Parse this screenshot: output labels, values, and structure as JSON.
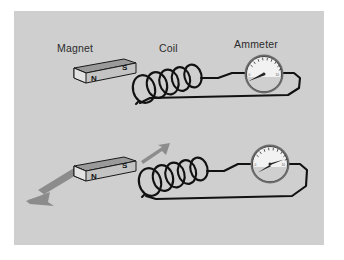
{
  "figure": {
    "panel_background": "#cfcfcf",
    "page_background": "#ffffff",
    "wire_color": "#111111",
    "magnet_body_color": "#c3c3c3",
    "magnet_top_color": "#9a9a9a",
    "magnet_end_color": "#e2e2e2",
    "arrow_color": "#8c8c8c",
    "gauge_face_color": "#f2f2f2",
    "gauge_rim_color": "#6d6d6d",
    "label_color": "#2b2b2b"
  },
  "labels": {
    "magnet": "Magnet",
    "coil": "Coil",
    "ammeter": "Ammeter"
  },
  "magnet": {
    "north_pole": "N",
    "south_pole": "S"
  },
  "panels": [
    {
      "id": "top",
      "name": "stationary-magnet-panel",
      "magnet_moving": false,
      "motion_arrow_visible": false,
      "ammeter_reading_label": "0",
      "needle_angle_deg": 200
    },
    {
      "id": "bottom",
      "name": "moving-magnet-panel",
      "magnet_moving": true,
      "motion_arrow_visible": true,
      "motion_direction": "away-from-coil",
      "ammeter_reading_label": "deflected",
      "needle_angle_deg": 330
    }
  ],
  "gauge_ticks": {
    "count": 9,
    "minor_count": 17,
    "scale_min_label": "0",
    "scale_max_label": "10"
  },
  "coil": {
    "turns": 5
  }
}
